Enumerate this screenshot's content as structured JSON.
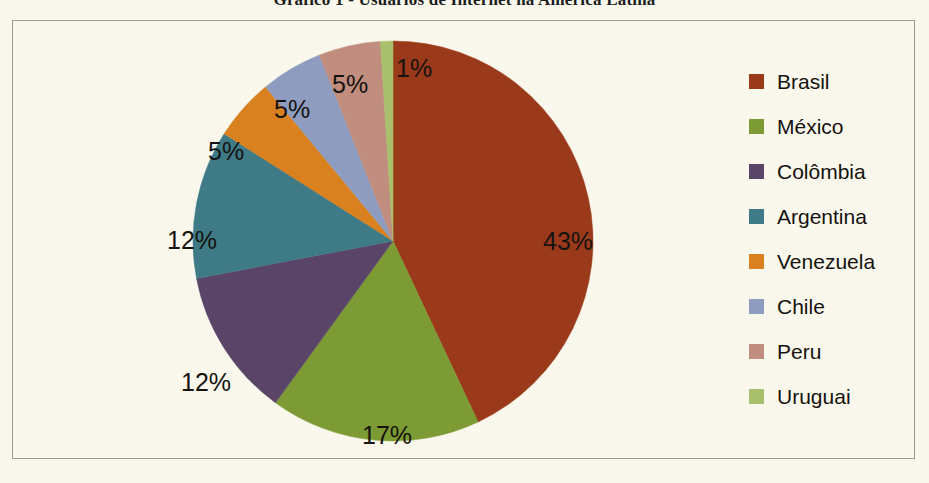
{
  "title": "Gráfico 1 - Usuários de Internet na América Latina",
  "chart_data": {
    "type": "pie",
    "title": "Gráfico 1 - Usuários de Internet na América Latina",
    "xlabel": "",
    "ylabel": "",
    "legend_position": "right",
    "grid": false,
    "unit": "%",
    "start_angle_deg": 0,
    "direction": "clockwise",
    "categories": [
      "Brasil",
      "México",
      "Colômbia",
      "Argentina",
      "Venezuela",
      "Chile",
      "Peru",
      "Uruguai"
    ],
    "values": [
      43,
      17,
      12,
      12,
      5,
      5,
      5,
      1
    ],
    "value_labels": [
      "43%",
      "17%",
      "12%",
      "12%",
      "5%",
      "5%",
      "5%",
      "1%"
    ],
    "colors": [
      "#9b3a1b",
      "#7d9b34",
      "#5a4569",
      "#3f7b87",
      "#d9811f",
      "#8e9cc0",
      "#c08d7e",
      "#a8c06b"
    ],
    "slices": [
      {
        "label": "Brasil",
        "value": 43,
        "value_label": "43%",
        "color": "#9b3a1b"
      },
      {
        "label": "México",
        "value": 17,
        "value_label": "17%",
        "color": "#7d9b34"
      },
      {
        "label": "Colômbia",
        "value": 12,
        "value_label": "12%",
        "color": "#5a4569"
      },
      {
        "label": "Argentina",
        "value": 12,
        "value_label": "12%",
        "color": "#3f7b87"
      },
      {
        "label": "Venezuela",
        "value": 5,
        "value_label": "5%",
        "color": "#d9811f"
      },
      {
        "label": "Chile",
        "value": 5,
        "value_label": "5%",
        "color": "#8e9cc0"
      },
      {
        "label": "Peru",
        "value": 5,
        "value_label": "5%",
        "color": "#c08d7e"
      },
      {
        "label": "Uruguai",
        "value": 1,
        "value_label": "1%",
        "color": "#a8c06b"
      }
    ]
  },
  "labels": {
    "brasil": "43%",
    "mexico": "17%",
    "colombia": "12%",
    "argentina": "12%",
    "venezuela": "5%",
    "chile": "5%",
    "peru": "5%",
    "uruguai": "1%"
  },
  "legend": {
    "items": [
      {
        "label": "Brasil",
        "color": "#9b3a1b"
      },
      {
        "label": "México",
        "color": "#7d9b34"
      },
      {
        "label": "Colômbia",
        "color": "#5a4569"
      },
      {
        "label": "Argentina",
        "color": "#3f7b87"
      },
      {
        "label": "Venezuela",
        "color": "#d9811f"
      },
      {
        "label": "Chile",
        "color": "#8e9cc0"
      },
      {
        "label": "Peru",
        "color": "#c08d7e"
      },
      {
        "label": "Uruguai",
        "color": "#a8c06b"
      }
    ]
  },
  "style": {
    "background": "#faf8ec",
    "frame_border": "#9c9c93",
    "text": "#15120f"
  }
}
